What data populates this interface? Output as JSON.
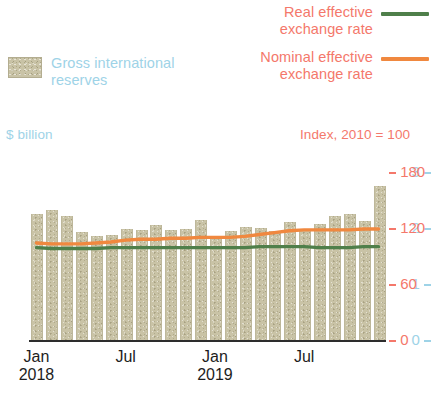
{
  "legend": {
    "reserves": {
      "label": "Gross international reserves",
      "swatch": "bar-swatch",
      "color": "#c9c3a6",
      "text_color": "#9ed3e7"
    },
    "reer": {
      "label": "Real effective exchange rate",
      "color": "#4f7f4a",
      "text_color": "#f4786b"
    },
    "neer": {
      "label": "Nominal effective exchange rate",
      "color": "#f0883f",
      "text_color": "#f4786b"
    }
  },
  "axes": {
    "left_caption": "$ billion",
    "right_caption": "Index, 2010 = 100",
    "left_ticks": [
      "3",
      "2",
      "1",
      "0"
    ],
    "right_ticks": [
      "180",
      "120",
      "60",
      "0"
    ]
  },
  "xaxis": {
    "labels": [
      {
        "month": "Jan",
        "year": "2018"
      },
      {
        "month": "Jul",
        "year": ""
      },
      {
        "month": "Jan",
        "year": "2019"
      },
      {
        "month": "Jul",
        "year": ""
      }
    ]
  },
  "chart_data": {
    "type": "bar",
    "title": "",
    "xlabel": "",
    "ylabel": "$ billion",
    "y2label": "Index, 2010 = 100",
    "ylim": [
      0,
      3
    ],
    "y2lim": [
      0,
      180
    ],
    "grid": false,
    "legend_position": "top",
    "categories": [
      "Jan 2018",
      "Feb 2018",
      "Mar 2018",
      "Apr 2018",
      "May 2018",
      "Jun 2018",
      "Jul 2018",
      "Aug 2018",
      "Sep 2018",
      "Oct 2018",
      "Nov 2018",
      "Dec 2018",
      "Jan 2019",
      "Feb 2019",
      "Mar 2019",
      "Apr 2019",
      "May 2019",
      "Jun 2019",
      "Jul 2019",
      "Aug 2019",
      "Sep 2019",
      "Oct 2019",
      "Nov 2019",
      "Dec 2019"
    ],
    "series": [
      {
        "name": "Gross international reserves",
        "axis": "left",
        "type": "bar",
        "unit": "$ billion",
        "color": "#c9c3a6",
        "values": [
          2.25,
          2.32,
          2.22,
          1.92,
          1.86,
          1.88,
          1.98,
          1.97,
          2.05,
          1.96,
          1.98,
          2.15,
          1.8,
          1.95,
          2.02,
          2.0,
          1.95,
          2.1,
          1.98,
          2.08,
          2.22,
          2.25,
          2.12,
          2.75
        ]
      },
      {
        "name": "Real effective exchange rate",
        "axis": "right",
        "type": "line",
        "unit": "Index, 2010 = 100",
        "color": "#4f7f4a",
        "values": [
          99,
          98,
          98,
          98,
          98,
          99,
          99,
          99,
          99,
          99,
          99,
          99,
          99,
          99,
          99,
          100,
          100,
          100,
          100,
          99,
          99,
          99,
          100,
          100
        ]
      },
      {
        "name": "Nominal effective exchange rate",
        "axis": "right",
        "type": "line",
        "unit": "Index, 2010 = 100",
        "color": "#f0883f",
        "values": [
          104,
          103,
          103,
          103,
          104,
          105,
          107,
          108,
          108,
          109,
          109,
          110,
          110,
          110,
          111,
          113,
          115,
          117,
          118,
          118,
          118,
          118,
          119,
          119
        ]
      }
    ]
  }
}
